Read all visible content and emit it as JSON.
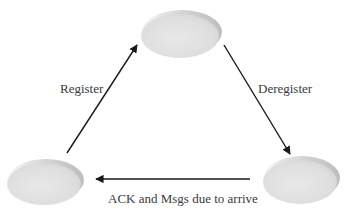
{
  "diagram": {
    "type": "state-cycle",
    "nodes": [
      {
        "id": "top",
        "label": "",
        "cx": 180,
        "cy": 35,
        "rx": 40,
        "ry": 23
      },
      {
        "id": "bottom-left",
        "label": "",
        "cx": 44,
        "cy": 183,
        "rx": 38,
        "ry": 22
      },
      {
        "id": "bottom-right",
        "label": "",
        "cx": 300,
        "cy": 181,
        "rx": 38,
        "ry": 23
      }
    ],
    "edges": [
      {
        "from": "bottom-left",
        "to": "top",
        "label": "Register"
      },
      {
        "from": "top",
        "to": "bottom-right",
        "label": "Deregister"
      },
      {
        "from": "bottom-right",
        "to": "bottom-left",
        "label": "ACK and Msgs due to arrive"
      }
    ]
  },
  "labels": {
    "register": "Register",
    "deregister": "Deregister",
    "ack": "ACK and Msgs due to arrive"
  },
  "colors": {
    "node_fill": "#e3e3e3",
    "node_rim": "#cfcfcf",
    "arrow": "#1a1a1a",
    "text": "#3a3a3a"
  }
}
